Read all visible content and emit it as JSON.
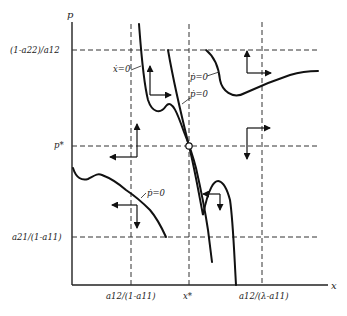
{
  "diagram": {
    "axes": {
      "x_label": "x",
      "y_label": "p"
    },
    "y_ticks": [
      {
        "id": "top",
        "label": "(1-a22)/a12"
      },
      {
        "id": "mid",
        "label": "p*"
      },
      {
        "id": "bottom",
        "label": "a21/(1-a11)"
      }
    ],
    "x_ticks": [
      {
        "id": "left",
        "label": "a12/(1-a11)"
      },
      {
        "id": "mid",
        "label": "x*"
      },
      {
        "id": "right",
        "label": "a12/(λ-a11)"
      }
    ],
    "curve_labels": {
      "x_dot_zero": "ẋ=0",
      "p_dot_zero_upper_right": "ṗ=0",
      "p_dot_zero_steep": "ṗ=0",
      "p_dot_zero_lower_left": "ṗ=0"
    },
    "equilibrium": "(x*, p*)",
    "direction_arrows": [
      {
        "region": "upper-left",
        "horizontal": "right",
        "vertical": "up"
      },
      {
        "region": "upper-right",
        "horizontal": "right",
        "vertical": "up"
      },
      {
        "region": "middle-left",
        "horizontal": "left",
        "vertical": "up"
      },
      {
        "region": "middle-right",
        "horizontal": "right",
        "vertical": "down"
      },
      {
        "region": "lower-left",
        "horizontal": "left",
        "vertical": "down"
      },
      {
        "region": "lower-center",
        "horizontal": "left",
        "vertical": "down"
      }
    ]
  }
}
